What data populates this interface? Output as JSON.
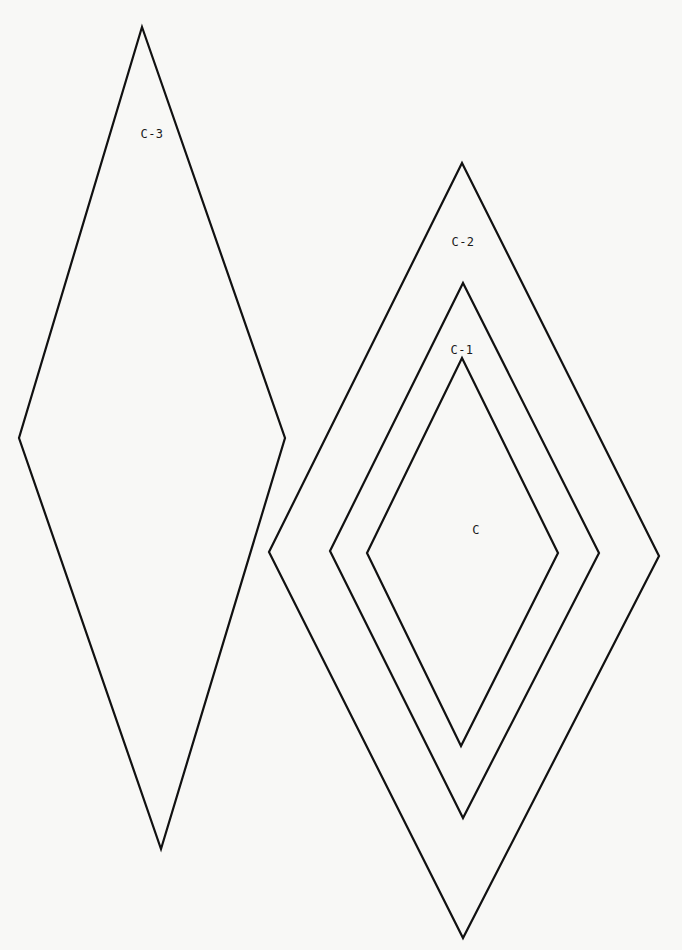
{
  "diagram": {
    "title": "",
    "stroke_color": "#111111",
    "background_color": "#f8f8f6",
    "shapes": [
      {
        "id": "C-3",
        "label": "C-3",
        "type": "diamond",
        "points": [
          [
            142,
            27
          ],
          [
            285,
            438
          ],
          [
            161,
            849
          ],
          [
            19,
            438
          ]
        ],
        "label_pos": [
          152,
          134
        ]
      },
      {
        "id": "C-2",
        "label": "C-2",
        "type": "diamond",
        "points": [
          [
            462,
            163
          ],
          [
            659,
            556
          ],
          [
            463,
            938
          ],
          [
            269,
            552
          ]
        ],
        "label_pos": [
          463,
          242
        ]
      },
      {
        "id": "C-1",
        "label": "C-1",
        "type": "diamond",
        "points": [
          [
            463,
            283
          ],
          [
            599,
            553
          ],
          [
            463,
            818
          ],
          [
            330,
            551
          ]
        ],
        "label_pos": [
          462,
          350
        ]
      },
      {
        "id": "C",
        "label": "C",
        "type": "diamond",
        "points": [
          [
            462,
            358
          ],
          [
            558,
            553
          ],
          [
            461,
            746
          ],
          [
            367,
            553
          ]
        ],
        "label_pos": [
          476,
          530
        ]
      }
    ]
  }
}
